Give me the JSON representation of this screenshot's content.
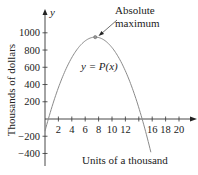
{
  "chart_data": {
    "type": "line",
    "title": "",
    "xlabel": "Units of a thousand",
    "ylabel": "Thousands of dollars",
    "y_axis_symbol": "y",
    "x_ticks": [
      2,
      4,
      6,
      8,
      10,
      12,
      14,
      16,
      18,
      20
    ],
    "x_tick_labels": [
      "2",
      "4",
      "6",
      "8",
      "10",
      "12",
      "",
      "16",
      "18",
      "20"
    ],
    "y_ticks": [
      1000,
      800,
      600,
      400,
      200,
      -200,
      -400
    ],
    "y_tick_labels": [
      "1000",
      "800",
      "600",
      "400",
      "200",
      "−200",
      "−400"
    ],
    "xlim": [
      0,
      21.5
    ],
    "ylim": [
      -500,
      1250
    ],
    "grid": false,
    "legend": null,
    "series": [
      {
        "name": "y = P(x)",
        "shape": "downward parabola",
        "vertex": {
          "x": 7.5,
          "y": 950
        },
        "roots": [
          0.5,
          14.5
        ],
        "x": [
          0,
          1,
          2,
          3,
          4,
          5,
          6,
          7,
          7.5,
          8,
          9,
          10,
          11,
          12,
          13,
          14,
          15,
          15.8
        ],
        "values": [
          -140,
          90,
          364,
          557,
          713,
          829,
          906,
          945,
          950,
          945,
          906,
          829,
          713,
          557,
          364,
          132,
          -140,
          -386
        ],
        "color": "#8a8a8a"
      }
    ],
    "annotations": [
      {
        "text_line1": "Absolute",
        "text_line2": "maximum",
        "points_to": {
          "x": 7.5,
          "y": 950
        }
      },
      {
        "text": "y = P(x)",
        "at": {
          "x": 7.5,
          "y": 600
        }
      }
    ]
  }
}
